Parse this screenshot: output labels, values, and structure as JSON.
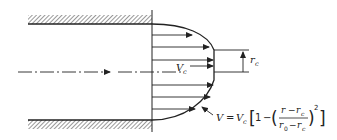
{
  "diagram": {
    "type": "velocity-profile-pipe-flow",
    "colors": {
      "ink": "#222222",
      "background": "#ffffff"
    },
    "labels": {
      "core_velocity_main": "V",
      "core_velocity_sub": "c",
      "core_radius_main": "r",
      "core_radius_sub": "c"
    },
    "formula": {
      "lhs": "V",
      "eq": "=",
      "vc_main": "V",
      "vc_sub": "c",
      "bracket_open": "[",
      "one": "1",
      "minus": "−",
      "paren_open": "(",
      "num_r": "r",
      "num_minus": "−",
      "num_rc_main": "r",
      "num_rc_sub": "c",
      "den_r0_main": "r",
      "den_r0_sub": "0",
      "den_minus": "−",
      "den_rc_main": "r",
      "den_rc_sub": "c",
      "paren_close": ")",
      "exponent": "2",
      "bracket_close": "]"
    },
    "arrows_y": [
      35,
      47,
      60,
      66,
      85,
      97,
      109
    ]
  }
}
